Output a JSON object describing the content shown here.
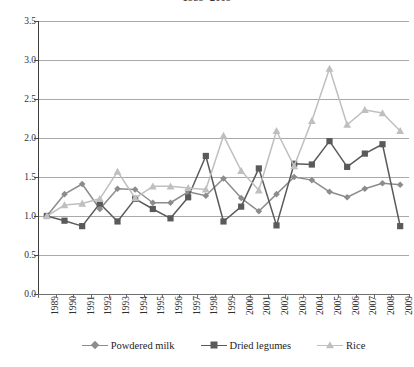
{
  "chart": {
    "title": "1989–2009",
    "ylabel": "",
    "xlabel": ""
  },
  "legend": {
    "items": [
      {
        "label": "Powdered milk",
        "color": "#8c8c8c",
        "marker": "diamond"
      },
      {
        "label": "Dried legumes",
        "color": "#5a5a5a",
        "marker": "square"
      },
      {
        "label": "Rice",
        "color": "#bfbfbf",
        "marker": "triangle"
      }
    ]
  },
  "chart_data": {
    "type": "line",
    "title": "1989–2009",
    "xlabel": "",
    "ylabel": "",
    "ylim": [
      0.0,
      3.5
    ],
    "ytick_labels": [
      "3.5",
      "3.0",
      "2.5",
      "2.0",
      "1.5",
      "1.0",
      "0.5",
      "0.0"
    ],
    "ytick_values": [
      3.5,
      3.0,
      2.5,
      2.0,
      1.5,
      1.0,
      0.5,
      0.0
    ],
    "grid": true,
    "legend_position": "bottom",
    "categories": [
      "1989",
      "1990",
      "1991",
      "1992",
      "1993",
      "1994",
      "1995",
      "1996",
      "1997",
      "1998",
      "1999",
      "2000",
      "2001",
      "2002",
      "2003",
      "2004",
      "2005",
      "2006",
      "2007",
      "2008",
      "2009"
    ],
    "series": [
      {
        "name": "Powdered milk",
        "color": "#8c8c8c",
        "marker": "diamond",
        "values": [
          1.0,
          1.28,
          1.41,
          1.09,
          1.35,
          1.34,
          1.17,
          1.17,
          1.31,
          1.26,
          1.48,
          1.23,
          1.06,
          1.28,
          1.5,
          1.46,
          1.31,
          1.24,
          1.35,
          1.42,
          1.4
        ]
      },
      {
        "name": "Dried legumes",
        "color": "#5a5a5a",
        "marker": "square",
        "values": [
          1.0,
          0.94,
          0.87,
          1.16,
          0.93,
          1.22,
          1.09,
          0.97,
          1.24,
          1.77,
          0.93,
          1.12,
          1.61,
          0.88,
          1.67,
          1.66,
          1.96,
          1.63,
          1.8,
          1.92,
          0.87
        ]
      },
      {
        "name": "Rice",
        "color": "#bfbfbf",
        "marker": "triangle",
        "values": [
          1.0,
          1.14,
          1.16,
          1.22,
          1.57,
          1.23,
          1.38,
          1.38,
          1.36,
          1.34,
          2.03,
          1.58,
          1.33,
          2.09,
          1.64,
          2.22,
          2.89,
          2.17,
          2.36,
          2.32,
          2.09
        ]
      }
    ]
  }
}
